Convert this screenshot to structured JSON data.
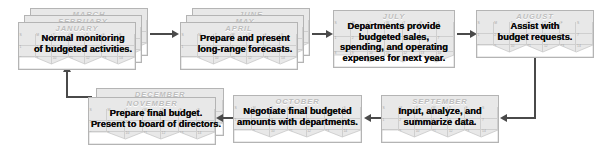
{
  "diagram": {
    "card_fill": "#e8e8e8",
    "card_border": "#b4b4b4",
    "month_color": "#bdbdbd",
    "text_color": "#0d0d0d",
    "arrow_color": "#4a4a4a"
  },
  "steps": [
    {
      "id": "step-january",
      "months": [
        "MARCH",
        "FEBRUARY",
        "JANUARY"
      ],
      "front_month": "JANUARY",
      "lines": [
        "Normal monitoring",
        "of budgeted activities."
      ]
    },
    {
      "id": "step-april",
      "months": [
        "JUNE",
        "MAY",
        "APRIL"
      ],
      "front_month": "APRIL",
      "lines": [
        "Prepare and present",
        "long-range forecasts."
      ]
    },
    {
      "id": "step-july",
      "months": [
        "JULY"
      ],
      "front_month": "JULY",
      "lines": [
        "Departments provide",
        "budgeted sales,",
        "spending, and operating",
        "expenses for next year."
      ]
    },
    {
      "id": "step-august",
      "months": [
        "AUGUST"
      ],
      "front_month": "AUGUST",
      "lines": [
        "Assist with",
        "budget requests."
      ]
    },
    {
      "id": "step-september",
      "months": [
        "SEPTEMBER"
      ],
      "front_month": "SEPTEMBER",
      "lines": [
        "Input, analyze, and",
        "summarize data."
      ]
    },
    {
      "id": "step-october",
      "months": [
        "OCTOBER"
      ],
      "front_month": "OCTOBER",
      "lines": [
        "Negotiate final budgeted",
        "amounts with departments."
      ]
    },
    {
      "id": "step-november",
      "months": [
        "DECEMBER",
        "NOVEMBER"
      ],
      "front_month": "NOVEMBER",
      "lines": [
        "Prepare final budget.",
        "Present to board of directors."
      ]
    }
  ],
  "connectors": [
    {
      "id": "arrow-january-to-april",
      "direction": "right"
    },
    {
      "id": "arrow-april-to-july",
      "direction": "right"
    },
    {
      "id": "arrow-july-to-august",
      "direction": "right"
    },
    {
      "id": "arrow-august-to-september",
      "direction": "left"
    },
    {
      "id": "arrow-september-to-october",
      "direction": "left"
    },
    {
      "id": "arrow-october-to-november",
      "direction": "left"
    },
    {
      "id": "arrow-november-to-january",
      "direction": "up"
    }
  ]
}
